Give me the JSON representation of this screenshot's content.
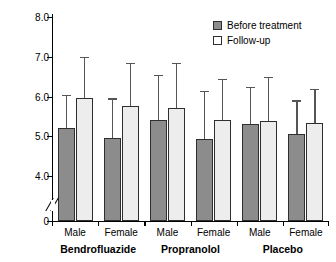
{
  "chart_data": {
    "type": "bar",
    "title": "",
    "xlabel": "",
    "ylabel": "Serum urea (mol/L)",
    "ylim": [
      4.0,
      8.0
    ],
    "y_axis_break": true,
    "y_axis_break_note": "axis broken between 0 and 4.0",
    "yticks": [
      "0",
      "4.0",
      "5.0",
      "6.0",
      "7.0",
      "8.0"
    ],
    "ytick_values": [
      0,
      4.0,
      5.0,
      6.0,
      7.0,
      8.0
    ],
    "grid": false,
    "legend_position": "top-right",
    "error_bars": "upper only",
    "groups": [
      "Bendrofluazide",
      "Propranolol",
      "Placebo"
    ],
    "categories": [
      "Male",
      "Female",
      "Male",
      "Female",
      "Male",
      "Female"
    ],
    "series": [
      {
        "name": "Before treatment",
        "color": "#8c8c8c",
        "values": [
          5.2,
          4.95,
          5.4,
          4.92,
          5.3,
          5.05
        ],
        "error_upper": [
          6.05,
          5.95,
          6.55,
          6.15,
          6.25,
          5.9
        ]
      },
      {
        "name": "Follow-up",
        "color": "#ededed",
        "values": [
          5.95,
          5.77,
          5.72,
          5.4,
          5.38,
          5.33
        ],
        "error_upper": [
          7.0,
          6.85,
          6.85,
          6.45,
          6.5,
          6.2
        ]
      }
    ]
  },
  "legend": {
    "items": [
      {
        "label": "Before treatment",
        "swatch": "before"
      },
      {
        "label": "Follow-up",
        "swatch": "follow"
      }
    ]
  },
  "axis": {
    "y_title": "Serum urea (mol/L)"
  }
}
